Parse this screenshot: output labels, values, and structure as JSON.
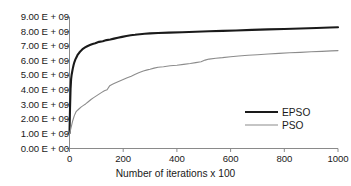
{
  "chart_data": {
    "type": "line",
    "title": "",
    "xlabel": "Number of iterations x 100",
    "ylabel": "",
    "xlim": [
      0,
      1000
    ],
    "ylim": [
      0,
      9000000000
    ],
    "grid": false,
    "legend_position": "inside-right",
    "x_tick_labels": [
      "0",
      "200",
      "400",
      "600",
      "800",
      "1000"
    ],
    "x_ticks": [
      0,
      200,
      400,
      600,
      800,
      1000
    ],
    "y_tick_labels": [
      "0.00 E + 00",
      "1.00 E + 09",
      "2.00 E + 09",
      "3.00 E + 09",
      "4.00 E + 09",
      "5.00 E + 09",
      "6.00 E + 09",
      "7.00 E + 09",
      "8.00 E + 09",
      "9.00 E + 09"
    ],
    "y_ticks": [
      0,
      1000000000,
      2000000000,
      3000000000,
      4000000000,
      5000000000,
      6000000000,
      7000000000,
      8000000000,
      9000000000
    ],
    "series": [
      {
        "name": "EPSO",
        "color": "#1a1a1a",
        "width": 2.1,
        "x": [
          0,
          2,
          4,
          6,
          8,
          10,
          12,
          15,
          18,
          22,
          26,
          30,
          36,
          42,
          50,
          58,
          66,
          76,
          86,
          96,
          110,
          124,
          138,
          152,
          166,
          180,
          196,
          212,
          228,
          244,
          252,
          262,
          280,
          300,
          330,
          370,
          420,
          470,
          520,
          570,
          620,
          680,
          740,
          800,
          860,
          920,
          970,
          1000
        ],
        "y": [
          1050000000.0,
          2800000000.0,
          4100000000.0,
          4750000000.0,
          5050000000.0,
          5250000000.0,
          5450000000.0,
          5700000000.0,
          5900000000.0,
          6100000000.0,
          6250000000.0,
          6400000000.0,
          6550000000.0,
          6680000000.0,
          6820000000.0,
          6920000000.0,
          7000000000.0,
          7080000000.0,
          7150000000.0,
          7200000000.0,
          7300000000.0,
          7340000000.0,
          7420000000.0,
          7460000000.0,
          7520000000.0,
          7580000000.0,
          7640000000.0,
          7700000000.0,
          7750000000.0,
          7780000000.0,
          7800000000.0,
          7820000000.0,
          7850000000.0,
          7880000000.0,
          7900000000.0,
          7930000000.0,
          7960000000.0,
          7990000000.0,
          8020000000.0,
          8050000000.0,
          8080000000.0,
          8120000000.0,
          8150000000.0,
          8180000000.0,
          8210000000.0,
          8250000000.0,
          8280000000.0,
          8300000000.0
        ]
      },
      {
        "name": "PSO",
        "color": "#8c8c8c",
        "width": 1.1,
        "x": [
          0,
          6,
          12,
          18,
          24,
          30,
          36,
          44,
          52,
          60,
          70,
          80,
          90,
          100,
          110,
          120,
          130,
          140,
          150,
          160,
          170,
          185,
          200,
          215,
          230,
          245,
          260,
          275,
          290,
          300,
          315,
          330,
          350,
          375,
          400,
          425,
          450,
          470,
          490,
          505,
          520,
          545,
          570,
          600,
          630,
          665,
          700,
          740,
          780,
          820,
          860,
          900,
          940,
          975,
          1000
        ],
        "y": [
          980000000.0,
          1450000000.0,
          1900000000.0,
          2250000000.0,
          2500000000.0,
          2620000000.0,
          2720000000.0,
          2850000000.0,
          2950000000.0,
          3050000000.0,
          3200000000.0,
          3350000000.0,
          3480000000.0,
          3600000000.0,
          3720000000.0,
          3840000000.0,
          3950000000.0,
          4020000000.0,
          4300000000.0,
          4400000000.0,
          4480000000.0,
          4600000000.0,
          4720000000.0,
          4840000000.0,
          4950000000.0,
          5080000000.0,
          5200000000.0,
          5300000000.0,
          5380000000.0,
          5420000000.0,
          5500000000.0,
          5560000000.0,
          5600000000.0,
          5660000000.0,
          5700000000.0,
          5760000000.0,
          5820000000.0,
          5880000000.0,
          5940000000.0,
          6050000000.0,
          6120000000.0,
          6180000000.0,
          6220000000.0,
          6280000000.0,
          6330000000.0,
          6380000000.0,
          6420000000.0,
          6470000000.0,
          6510000000.0,
          6550000000.0,
          6580000000.0,
          6620000000.0,
          6650000000.0,
          6680000000.0,
          6700000000.0
        ]
      }
    ]
  },
  "legend": {
    "entries": [
      {
        "label": "EPSO"
      },
      {
        "label": "PSO"
      }
    ]
  },
  "axes": {
    "x_title": "Number of iterations x 100"
  }
}
